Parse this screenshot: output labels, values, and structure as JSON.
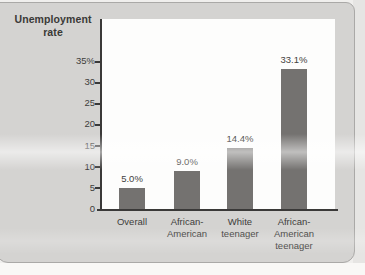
{
  "figure": {
    "ylabel_line1": "Unemployment",
    "ylabel_line2": "rate"
  },
  "colors": {
    "bar": "#747270",
    "panel_background": "#d4d3d1",
    "plot_background": "#fdfdfc",
    "axis": "#3a3938",
    "text": "#3e3d3b",
    "panel_border": "#aaa9a7"
  },
  "chart_data": {
    "type": "bar",
    "title": "",
    "ylabel": "Unemployment rate",
    "xlabel": "",
    "categories": [
      "Overall",
      "African-American",
      "White teenager",
      "African-American teenager"
    ],
    "category_lines": [
      [
        "Overall"
      ],
      [
        "African-",
        "American"
      ],
      [
        "White",
        "teenager"
      ],
      [
        "African-",
        "American",
        "teenager"
      ]
    ],
    "values": [
      5.0,
      9.0,
      14.4,
      33.1
    ],
    "value_labels": [
      "5.0%",
      "9.0%",
      "14.4%",
      "33.1%"
    ],
    "yticks": [
      35,
      30,
      25,
      20,
      15,
      10,
      5,
      0
    ],
    "ytick_labels": [
      "35%",
      "30",
      "25",
      "20",
      "15",
      "10",
      "5",
      "0"
    ],
    "ylim": [
      0,
      35
    ],
    "grid": false,
    "legend": "none",
    "bar_color": "#747270"
  }
}
